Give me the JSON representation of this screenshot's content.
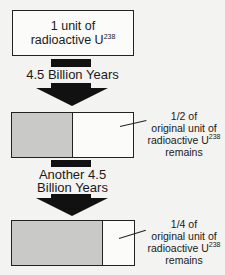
{
  "top_box": {
    "line1": "1 unit of",
    "line2": "radioactive U",
    "isotope_mass": "238"
  },
  "step1": {
    "label": "4.5 Billion Years"
  },
  "box2": {
    "fraction_remaining": 0.5,
    "annotation": {
      "line1": "1/2 of",
      "line2": "original unit of",
      "line3": "radioactive U",
      "isotope_mass": "238",
      "line4": "remains"
    }
  },
  "step2": {
    "label_line1": "Another 4.5",
    "label_line2": "Billion Years"
  },
  "box3": {
    "fraction_remaining": 0.25,
    "annotation": {
      "line1": "1/4 of",
      "line2": "original unit of",
      "line3": "radioactive U",
      "isotope_mass": "238",
      "line4": "remains"
    }
  },
  "colors": {
    "decayed_fill": "#c9c9c7",
    "arrow": "#111111",
    "border": "#222222"
  }
}
